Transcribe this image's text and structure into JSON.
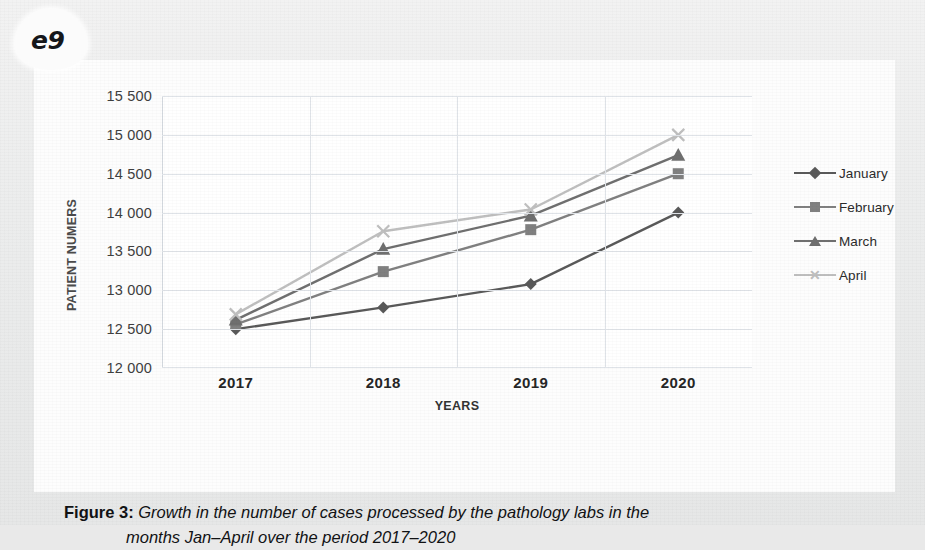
{
  "page": {
    "tab_label": "e9"
  },
  "caption": {
    "label": "Figure 3:",
    "line1": "Growth in the number of cases processed by the pathology labs in the",
    "line2": "months Jan–April over the period 2017–2020"
  },
  "chart_data": {
    "type": "line",
    "title": "",
    "xlabel": "YEARS",
    "ylabel": "PATIENT NUMERS",
    "categories": [
      "2017",
      "2018",
      "2019",
      "2020"
    ],
    "ytick_labels": [
      "12 000",
      "12 500",
      "13 000",
      "13 500",
      "14 000",
      "14 500",
      "15 000",
      "15 500"
    ],
    "ytick_values": [
      12000,
      12500,
      13000,
      13500,
      14000,
      14500,
      15000,
      15500
    ],
    "ylim": [
      12000,
      15500
    ],
    "grid": true,
    "legend_position": "right",
    "series": [
      {
        "name": "January",
        "values": [
          12500,
          12780,
          13080,
          14000
        ],
        "color": "#595959",
        "marker": "diamond"
      },
      {
        "name": "February",
        "values": [
          12560,
          13240,
          13780,
          14500
        ],
        "color": "#808080",
        "marker": "square"
      },
      {
        "name": "March",
        "values": [
          12620,
          13530,
          13960,
          14740
        ],
        "color": "#6f6f6f",
        "marker": "triangle"
      },
      {
        "name": "April",
        "values": [
          12690,
          13760,
          14040,
          15000
        ],
        "color": "#bfbfbf",
        "marker": "x"
      }
    ]
  }
}
